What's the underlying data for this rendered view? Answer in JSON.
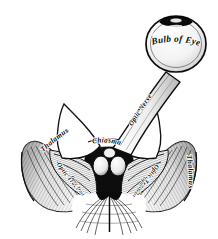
{
  "figure": {
    "style": "vintage steel engraving, black ink on white",
    "background_color": "#ffffff",
    "ink_color": "#0b0b0b"
  },
  "labels": {
    "bulb_of_eye": "Bulb of Eye",
    "optic_nerve": "Optic Nerve",
    "chiasma": "Chiasma",
    "thalamus_left": "Thalamus",
    "thalamus_right": "Thalamus",
    "optic_tract_left": "Optic Tract",
    "optic_tract_right": "Optic Tract",
    "inner_left": "Optic Tract",
    "inner_right": "Optic Tract"
  },
  "structures": {
    "eyeball": "Bulb of Eye",
    "cornea_cap": "cornea",
    "nerve_stalk": "Optic Nerve",
    "crossing": "Chiasma",
    "mammillary_bodies": "paired rounded bodies",
    "cerebral_peduncles": "striated fan",
    "left_wing": "Thalamus",
    "right_wing": "Thalamus"
  }
}
